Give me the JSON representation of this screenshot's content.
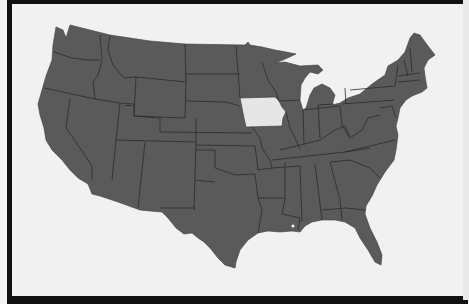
{
  "map": {
    "subject": "United States (contiguous 48 states)",
    "highlighted_state": "Iowa",
    "colors": {
      "states": "#5a5a5a",
      "highlight": "#e6e6e6",
      "background": "#f1f1f1",
      "frame": "#111111",
      "borders": "#2b2b2b"
    }
  }
}
